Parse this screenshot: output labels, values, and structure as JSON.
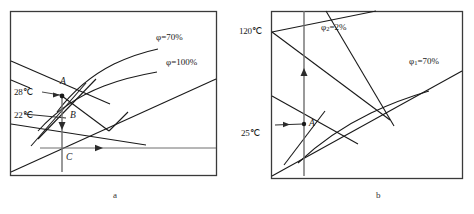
{
  "figure": {
    "type": "psychrometric-chart-pair",
    "panels": [
      {
        "id": "a",
        "caption": "a",
        "labels": {
          "phi70": "φ=70%",
          "phi100": "φ=100%",
          "t28": "28℃",
          "t22": "22℃",
          "pointA": "A",
          "pointB": "B",
          "pointC": "C"
        }
      },
      {
        "id": "b",
        "caption": "b",
        "labels": {
          "phi2": "φ₂=2%",
          "phi1": "φ₁=70%",
          "t120": "120℃",
          "t25": "25℃",
          "pointA": "A"
        }
      }
    ],
    "colors": {
      "frame": "#3a3a3a",
      "line": "#1a1a1a",
      "guide": "#6e6e6e",
      "text": "#1a1a1a",
      "caption": "#444444",
      "background": "#ffffff"
    }
  }
}
